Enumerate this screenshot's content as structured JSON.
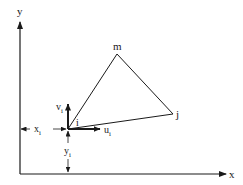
{
  "diagram": {
    "type": "triangular-element",
    "axes": {
      "x_label": "x",
      "y_label": "y"
    },
    "nodes": [
      {
        "id": "i",
        "label": "i",
        "x": 68,
        "y": 129
      },
      {
        "id": "j",
        "label": "j",
        "x": 173,
        "y": 114
      },
      {
        "id": "m",
        "label": "m",
        "x": 117,
        "y": 54
      }
    ],
    "displacements": {
      "u": {
        "base": "u",
        "sub": "i"
      },
      "v": {
        "base": "v",
        "sub": "i"
      }
    },
    "dimensions": {
      "x": {
        "base": "x",
        "sub": "i"
      },
      "y": {
        "base": "y",
        "sub": "i"
      }
    },
    "colors": {
      "line": "#1a1a1a",
      "background": "#ffffff"
    }
  }
}
